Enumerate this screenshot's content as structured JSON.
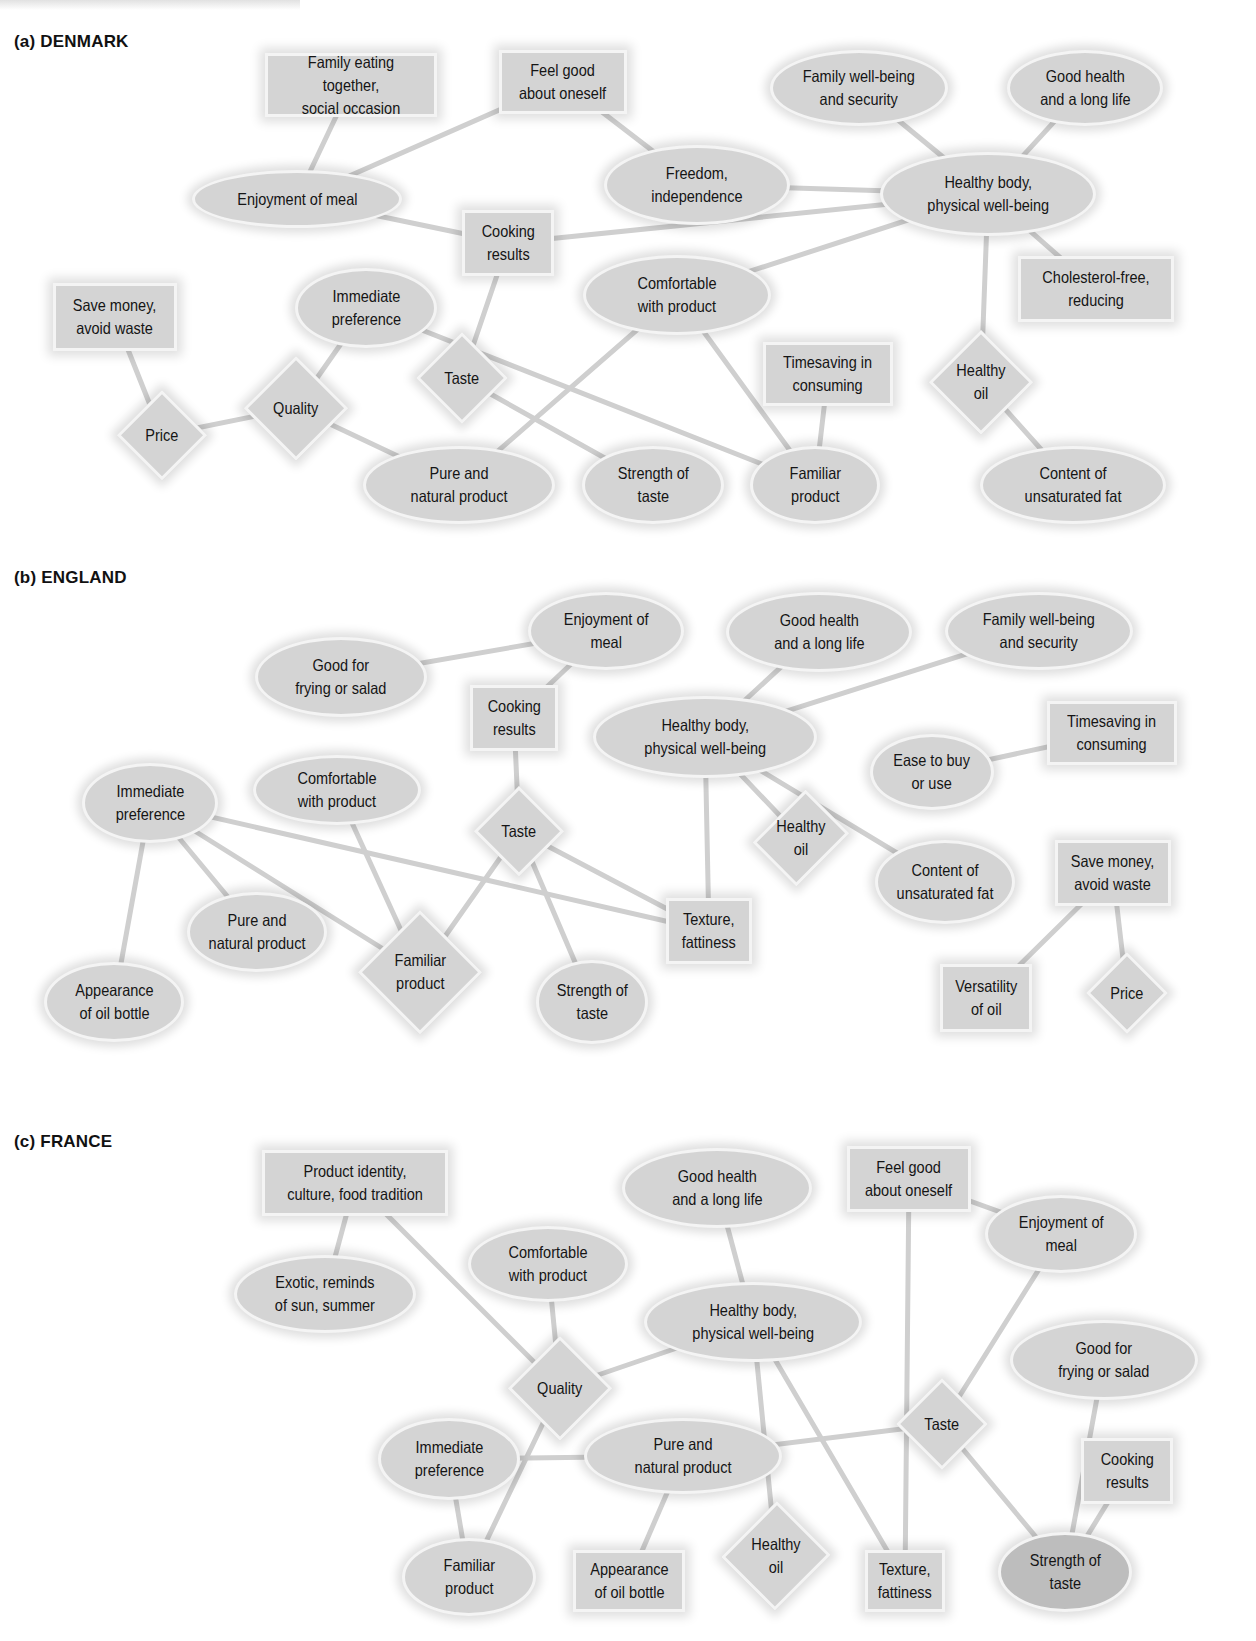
{
  "figure": {
    "sections": [
      {
        "id": "denmark",
        "title": "(a) DENMARK",
        "title_pos": [
          14,
          32
        ],
        "nodes": [
          {
            "id": "d_family_eating",
            "label": "Family eating together,\nsocial occasion",
            "shape": "rect",
            "x": 265,
            "y": 53,
            "w": 172,
            "h": 64
          },
          {
            "id": "d_feel_good",
            "label": "Feel good\nabout oneself",
            "shape": "rect",
            "x": 499,
            "y": 50,
            "w": 128,
            "h": 64
          },
          {
            "id": "d_family_wellbeing",
            "label": "Family well-being\nand security",
            "shape": "ellipse",
            "x": 770,
            "y": 50,
            "w": 178,
            "h": 76
          },
          {
            "id": "d_good_health",
            "label": "Good health\nand a long life",
            "shape": "ellipse",
            "x": 1007,
            "y": 50,
            "w": 156,
            "h": 76
          },
          {
            "id": "d_enjoyment",
            "label": "Enjoyment of meal",
            "shape": "ellipse",
            "x": 192,
            "y": 170,
            "w": 210,
            "h": 58
          },
          {
            "id": "d_freedom",
            "label": "Freedom,\nindependence",
            "shape": "ellipse",
            "x": 604,
            "y": 145,
            "w": 186,
            "h": 80
          },
          {
            "id": "d_healthy_body",
            "label": "Healthy body,\nphysical well-being",
            "shape": "ellipse",
            "x": 880,
            "y": 152,
            "w": 216,
            "h": 84
          },
          {
            "id": "d_cooking",
            "label": "Cooking\nresults",
            "shape": "rect",
            "x": 462,
            "y": 210,
            "w": 92,
            "h": 66
          },
          {
            "id": "d_comfortable",
            "label": "Comfortable\nwith product",
            "shape": "ellipse",
            "x": 583,
            "y": 255,
            "w": 188,
            "h": 80
          },
          {
            "id": "d_cholesterol",
            "label": "Cholesterol-free,\nreducing",
            "shape": "rect",
            "x": 1018,
            "y": 256,
            "w": 156,
            "h": 66
          },
          {
            "id": "d_save_money",
            "label": "Save money,\navoid waste",
            "shape": "rect",
            "x": 53,
            "y": 283,
            "w": 124,
            "h": 68
          },
          {
            "id": "d_immediate",
            "label": "Immediate\npreference",
            "shape": "ellipse",
            "x": 295,
            "y": 268,
            "w": 142,
            "h": 80
          },
          {
            "id": "d_taste",
            "label": "Taste",
            "shape": "diamond",
            "x": 416,
            "y": 332,
            "w": 92,
            "h": 92
          },
          {
            "id": "d_timesaving",
            "label": "Timesaving in\nconsuming",
            "shape": "rect",
            "x": 763,
            "y": 342,
            "w": 130,
            "h": 64
          },
          {
            "id": "d_healthy_oil",
            "label": "Healthy\noil",
            "shape": "diamond",
            "x": 929,
            "y": 330,
            "w": 104,
            "h": 104
          },
          {
            "id": "d_quality",
            "label": "Quality",
            "shape": "diamond",
            "x": 244,
            "y": 356,
            "w": 104,
            "h": 104
          },
          {
            "id": "d_price",
            "label": "Price",
            "shape": "diamond",
            "x": 117,
            "y": 390,
            "w": 90,
            "h": 90
          },
          {
            "id": "d_pure",
            "label": "Pure and\nnatural product",
            "shape": "ellipse",
            "x": 363,
            "y": 446,
            "w": 192,
            "h": 78
          },
          {
            "id": "d_strength",
            "label": "Strength of\ntaste",
            "shape": "ellipse",
            "x": 582,
            "y": 446,
            "w": 142,
            "h": 78
          },
          {
            "id": "d_familiar",
            "label": "Familiar\nproduct",
            "shape": "ellipse",
            "x": 750,
            "y": 446,
            "w": 130,
            "h": 78
          },
          {
            "id": "d_content",
            "label": "Content of\nunsaturated fat",
            "shape": "ellipse",
            "x": 980,
            "y": 446,
            "w": 186,
            "h": 78
          }
        ],
        "edges": [
          [
            "d_family_eating",
            "d_enjoyment"
          ],
          [
            "d_feel_good",
            "d_enjoyment"
          ],
          [
            "d_feel_good",
            "d_freedom"
          ],
          [
            "d_family_wellbeing",
            "d_healthy_body"
          ],
          [
            "d_good_health",
            "d_healthy_body"
          ],
          [
            "d_freedom",
            "d_healthy_body"
          ],
          [
            "d_enjoyment",
            "d_cooking"
          ],
          [
            "d_cooking",
            "d_healthy_body"
          ],
          [
            "d_comfortable",
            "d_healthy_body"
          ],
          [
            "d_healthy_body",
            "d_cholesterol"
          ],
          [
            "d_healthy_body",
            "d_healthy_oil"
          ],
          [
            "d_healthy_oil",
            "d_content"
          ],
          [
            "d_cooking",
            "d_taste"
          ],
          [
            "d_save_money",
            "d_price"
          ],
          [
            "d_price",
            "d_quality"
          ],
          [
            "d_quality",
            "d_immediate"
          ],
          [
            "d_quality",
            "d_pure"
          ],
          [
            "d_immediate",
            "d_familiar"
          ],
          [
            "d_taste",
            "d_strength"
          ],
          [
            "d_comfortable",
            "d_pure"
          ],
          [
            "d_comfortable",
            "d_familiar"
          ],
          [
            "d_timesaving",
            "d_familiar"
          ]
        ]
      },
      {
        "id": "england",
        "title": "(b) ENGLAND",
        "title_pos": [
          14,
          568
        ],
        "nodes": [
          {
            "id": "e_enjoyment",
            "label": "Enjoyment of\nmeal",
            "shape": "ellipse",
            "x": 528,
            "y": 592,
            "w": 156,
            "h": 78
          },
          {
            "id": "e_good_health",
            "label": "Good health\nand a long life",
            "shape": "ellipse",
            "x": 726,
            "y": 592,
            "w": 186,
            "h": 80
          },
          {
            "id": "e_family_wellbeing",
            "label": "Family well-being\nand security",
            "shape": "ellipse",
            "x": 945,
            "y": 592,
            "w": 188,
            "h": 78
          },
          {
            "id": "e_good_frying",
            "label": "Good for\nfrying or salad",
            "shape": "ellipse",
            "x": 255,
            "y": 637,
            "w": 172,
            "h": 80
          },
          {
            "id": "e_cooking",
            "label": "Cooking\nresults",
            "shape": "rect",
            "x": 470,
            "y": 685,
            "w": 88,
            "h": 66
          },
          {
            "id": "e_healthy_body",
            "label": "Healthy body,\nphysical well-being",
            "shape": "ellipse",
            "x": 593,
            "y": 696,
            "w": 224,
            "h": 82
          },
          {
            "id": "e_timesaving",
            "label": "Timesaving in\nconsuming",
            "shape": "rect",
            "x": 1047,
            "y": 701,
            "w": 130,
            "h": 64
          },
          {
            "id": "e_ease",
            "label": "Ease to buy\nor use",
            "shape": "ellipse",
            "x": 870,
            "y": 734,
            "w": 124,
            "h": 76
          },
          {
            "id": "e_comfortable",
            "label": "Comfortable\nwith product",
            "shape": "ellipse",
            "x": 253,
            "y": 755,
            "w": 168,
            "h": 70
          },
          {
            "id": "e_immediate",
            "label": "Immediate\npreference",
            "shape": "ellipse",
            "x": 82,
            "y": 763,
            "w": 136,
            "h": 80
          },
          {
            "id": "e_taste",
            "label": "Taste",
            "shape": "diamond",
            "x": 474,
            "y": 786,
            "w": 90,
            "h": 90
          },
          {
            "id": "e_healthy_oil",
            "label": "Healthy\noil",
            "shape": "diamond",
            "x": 757,
            "y": 785,
            "w": 88,
            "h": 106
          },
          {
            "id": "e_content",
            "label": "Content of\nunsaturated fat",
            "shape": "ellipse",
            "x": 875,
            "y": 840,
            "w": 140,
            "h": 84
          },
          {
            "id": "e_save_money",
            "label": "Save money,\navoid waste",
            "shape": "rect",
            "x": 1055,
            "y": 840,
            "w": 116,
            "h": 66
          },
          {
            "id": "e_pure",
            "label": "Pure and\nnatural product",
            "shape": "ellipse",
            "x": 187,
            "y": 892,
            "w": 140,
            "h": 80
          },
          {
            "id": "e_texture",
            "label": "Texture,\nfattiness",
            "shape": "rect",
            "x": 666,
            "y": 898,
            "w": 86,
            "h": 66
          },
          {
            "id": "e_familiar",
            "label": "Familiar\nproduct",
            "shape": "diamond",
            "x": 358,
            "y": 910,
            "w": 124,
            "h": 124
          },
          {
            "id": "e_appearance",
            "label": "Appearance\nof oil bottle",
            "shape": "ellipse",
            "x": 44,
            "y": 962,
            "w": 140,
            "h": 80
          },
          {
            "id": "e_strength",
            "label": "Strength of\ntaste",
            "shape": "ellipse",
            "x": 536,
            "y": 960,
            "w": 112,
            "h": 84
          },
          {
            "id": "e_versatility",
            "label": "Versatility\nof oil",
            "shape": "rect",
            "x": 940,
            "y": 964,
            "w": 92,
            "h": 68
          },
          {
            "id": "e_price",
            "label": "Price",
            "shape": "diamond",
            "x": 1086,
            "y": 952,
            "w": 82,
            "h": 82
          }
        ],
        "edges": [
          [
            "e_good_frying",
            "e_enjoyment"
          ],
          [
            "e_enjoyment",
            "e_cooking"
          ],
          [
            "e_good_health",
            "e_healthy_body"
          ],
          [
            "e_family_wellbeing",
            "e_healthy_body"
          ],
          [
            "e_ease",
            "e_timesaving"
          ],
          [
            "e_cooking",
            "e_taste"
          ],
          [
            "e_healthy_body",
            "e_healthy_oil"
          ],
          [
            "e_healthy_body",
            "e_content"
          ],
          [
            "e_healthy_body",
            "e_texture"
          ],
          [
            "e_immediate",
            "e_appearance"
          ],
          [
            "e_immediate",
            "e_pure"
          ],
          [
            "e_immediate",
            "e_familiar"
          ],
          [
            "e_immediate",
            "e_texture"
          ],
          [
            "e_comfortable",
            "e_familiar"
          ],
          [
            "e_taste",
            "e_familiar"
          ],
          [
            "e_taste",
            "e_strength"
          ],
          [
            "e_taste",
            "e_texture"
          ],
          [
            "e_save_money",
            "e_versatility"
          ],
          [
            "e_save_money",
            "e_price"
          ]
        ]
      },
      {
        "id": "france",
        "title": "(c) FRANCE",
        "title_pos": [
          14,
          1132
        ],
        "nodes": [
          {
            "id": "f_product_identity",
            "label": "Product identity,\nculture, food tradition",
            "shape": "rect",
            "x": 262,
            "y": 1150,
            "w": 186,
            "h": 66
          },
          {
            "id": "f_good_health",
            "label": "Good health\nand a long life",
            "shape": "ellipse",
            "x": 622,
            "y": 1148,
            "w": 190,
            "h": 80
          },
          {
            "id": "f_feel_good",
            "label": "Feel good\nabout oneself",
            "shape": "rect",
            "x": 847,
            "y": 1146,
            "w": 124,
            "h": 66
          },
          {
            "id": "f_comfortable",
            "label": "Comfortable\nwith product",
            "shape": "ellipse",
            "x": 468,
            "y": 1226,
            "w": 160,
            "h": 76
          },
          {
            "id": "f_exotic",
            "label": "Exotic, reminds\nof sun, summer",
            "shape": "ellipse",
            "x": 234,
            "y": 1255,
            "w": 182,
            "h": 78
          },
          {
            "id": "f_enjoyment",
            "label": "Enjoyment of\nmeal",
            "shape": "ellipse",
            "x": 985,
            "y": 1195,
            "w": 152,
            "h": 78
          },
          {
            "id": "f_healthy_body",
            "label": "Healthy body,\nphysical well-being",
            "shape": "ellipse",
            "x": 644,
            "y": 1282,
            "w": 218,
            "h": 80
          },
          {
            "id": "f_quality",
            "label": "Quality",
            "shape": "diamond",
            "x": 508,
            "y": 1336,
            "w": 104,
            "h": 104
          },
          {
            "id": "f_good_frying",
            "label": "Good for\nfrying or salad",
            "shape": "ellipse",
            "x": 1010,
            "y": 1320,
            "w": 188,
            "h": 80
          },
          {
            "id": "f_taste",
            "label": "Taste",
            "shape": "diamond",
            "x": 896,
            "y": 1378,
            "w": 92,
            "h": 92
          },
          {
            "id": "f_immediate",
            "label": "Immediate\npreference",
            "shape": "ellipse",
            "x": 378,
            "y": 1418,
            "w": 142,
            "h": 82
          },
          {
            "id": "f_pure",
            "label": "Pure and\nnatural product",
            "shape": "ellipse",
            "x": 584,
            "y": 1418,
            "w": 198,
            "h": 76
          },
          {
            "id": "f_cooking",
            "label": "Cooking\nresults",
            "shape": "rect",
            "x": 1081,
            "y": 1438,
            "w": 92,
            "h": 66
          },
          {
            "id": "f_healthy_oil",
            "label": "Healthy\noil",
            "shape": "diamond",
            "x": 722,
            "y": 1500,
            "w": 108,
            "h": 112
          },
          {
            "id": "f_familiar",
            "label": "Familiar\nproduct",
            "shape": "ellipse",
            "x": 402,
            "y": 1538,
            "w": 134,
            "h": 78
          },
          {
            "id": "f_appearance",
            "label": "Appearance\nof oil bottle",
            "shape": "rect",
            "x": 573,
            "y": 1550,
            "w": 112,
            "h": 62
          },
          {
            "id": "f_texture",
            "label": "Texture,\nfattiness",
            "shape": "rect",
            "x": 865,
            "y": 1550,
            "w": 80,
            "h": 62
          },
          {
            "id": "f_strength",
            "label": "Strength of\ntaste",
            "shape": "ellipse",
            "x": 998,
            "y": 1532,
            "w": 134,
            "h": 80,
            "dark": true
          }
        ],
        "edges": [
          [
            "f_product_identity",
            "f_exotic"
          ],
          [
            "f_product_identity",
            "f_quality"
          ],
          [
            "f_comfortable",
            "f_quality"
          ],
          [
            "f_good_health",
            "f_healthy_body"
          ],
          [
            "f_healthy_body",
            "f_quality"
          ],
          [
            "f_quality",
            "f_familiar"
          ],
          [
            "f_immediate",
            "f_pure"
          ],
          [
            "f_immediate",
            "f_familiar"
          ],
          [
            "f_pure",
            "f_appearance"
          ],
          [
            "f_pure",
            "f_taste"
          ],
          [
            "f_healthy_body",
            "f_healthy_oil"
          ],
          [
            "f_healthy_body",
            "f_texture"
          ],
          [
            "f_feel_good",
            "f_texture"
          ],
          [
            "f_feel_good",
            "f_enjoyment"
          ],
          [
            "f_enjoyment",
            "f_taste"
          ],
          [
            "f_taste",
            "f_strength"
          ],
          [
            "f_good_frying",
            "f_strength"
          ],
          [
            "f_cooking",
            "f_strength"
          ]
        ]
      }
    ],
    "colors": {
      "node_fill": "#d4d4d4",
      "node_fill_dark": "#bdbdbd",
      "node_border": "#f4f4f4",
      "edge": "#cfcfcf",
      "text": "#151515",
      "background": "#ffffff"
    },
    "legend_shapes": {
      "ellipse": "value / consequence",
      "rect": "consequence",
      "diamond": "attribute"
    }
  }
}
